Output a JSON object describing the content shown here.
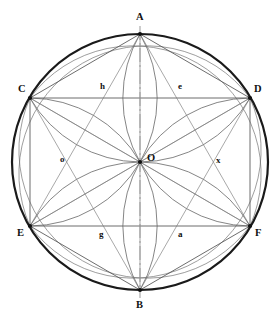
{
  "figure": {
    "canvas": {
      "width": 279,
      "height": 327
    },
    "colors": {
      "outer_circle": "#1a1a1a",
      "chord": "#555555",
      "arc": "#666666",
      "diagonal": "#777777",
      "centerline": "#999999",
      "vertex_dot": "#111111",
      "label": "#111111",
      "background": "#ffffff"
    },
    "circle": {
      "cx": 140,
      "cy": 162,
      "r": 128,
      "stroke_width": 2.2
    },
    "centerline": {
      "name": "vertical-axis",
      "x": 140,
      "y1": 26,
      "y2": 298,
      "dash": "14 3 2 3"
    },
    "vertices": [
      {
        "id": "A",
        "label": "A",
        "x": 140,
        "y": 34,
        "label_x": 136,
        "label_y": 12
      },
      {
        "id": "C",
        "label": "C",
        "x": 30,
        "y": 98,
        "label_x": 18,
        "label_y": 84
      },
      {
        "id": "D",
        "label": "D",
        "x": 250,
        "y": 98,
        "label_x": 254,
        "label_y": 84
      },
      {
        "id": "E",
        "label": "E",
        "x": 30,
        "y": 226,
        "label_x": 17,
        "label_y": 228
      },
      {
        "id": "F",
        "label": "F",
        "x": 250,
        "y": 226,
        "label_x": 255,
        "label_y": 228
      },
      {
        "id": "B",
        "label": "B",
        "x": 140,
        "y": 290,
        "label_x": 136,
        "label_y": 300
      },
      {
        "id": "O",
        "label": "O",
        "x": 140,
        "y": 162,
        "label_x": 147,
        "label_y": 153
      }
    ],
    "marks": [
      {
        "id": "h",
        "label": "h",
        "x": 100,
        "y": 82
      },
      {
        "id": "e",
        "label": "e",
        "x": 178,
        "y": 82
      },
      {
        "id": "o",
        "label": "o",
        "x": 60,
        "y": 155
      },
      {
        "id": "x",
        "label": "x",
        "x": 216,
        "y": 156
      },
      {
        "id": "g",
        "label": "g",
        "x": 99,
        "y": 230
      },
      {
        "id": "a",
        "label": "a",
        "x": 178,
        "y": 230
      }
    ],
    "chords": [
      {
        "name": "chord-CD",
        "x1": 30,
        "y1": 98,
        "x2": 250,
        "y2": 98
      },
      {
        "name": "chord-EF",
        "x1": 30,
        "y1": 226,
        "x2": 250,
        "y2": 226
      },
      {
        "name": "chord-CE",
        "x1": 30,
        "y1": 98,
        "x2": 30,
        "y2": 226
      },
      {
        "name": "chord-DF",
        "x1": 250,
        "y1": 98,
        "x2": 250,
        "y2": 226
      },
      {
        "name": "chord-AC",
        "x1": 140,
        "y1": 34,
        "x2": 30,
        "y2": 98
      },
      {
        "name": "chord-AD",
        "x1": 140,
        "y1": 34,
        "x2": 250,
        "y2": 98
      },
      {
        "name": "chord-BE",
        "x1": 140,
        "y1": 290,
        "x2": 30,
        "y2": 226
      },
      {
        "name": "chord-BF",
        "x1": 140,
        "y1": 290,
        "x2": 250,
        "y2": 226
      }
    ],
    "diagonals": [
      {
        "name": "diagonal-AE",
        "x1": 140,
        "y1": 34,
        "x2": 30,
        "y2": 226
      },
      {
        "name": "diagonal-AF",
        "x1": 140,
        "y1": 34,
        "x2": 250,
        "y2": 226
      },
      {
        "name": "diagonal-BC",
        "x1": 140,
        "y1": 290,
        "x2": 30,
        "y2": 98
      },
      {
        "name": "diagonal-BD",
        "x1": 140,
        "y1": 290,
        "x2": 250,
        "y2": 98
      },
      {
        "name": "diagonal-CF",
        "x1": 30,
        "y1": 98,
        "x2": 250,
        "y2": 226
      },
      {
        "name": "diagonal-DE",
        "x1": 250,
        "y1": 98,
        "x2": 30,
        "y2": 226
      },
      {
        "name": "diagonal-AO-B",
        "x1": 140,
        "y1": 34,
        "x2": 140,
        "y2": 290
      },
      {
        "name": "diagonal-CO-F",
        "x1": 30,
        "y1": 98,
        "x2": 140,
        "y2": 162
      },
      {
        "name": "diagonal-DO-E",
        "x1": 250,
        "y1": 98,
        "x2": 140,
        "y2": 162
      },
      {
        "name": "diagonal-EO",
        "x1": 30,
        "y1": 226,
        "x2": 140,
        "y2": 162
      },
      {
        "name": "diagonal-FO",
        "x1": 250,
        "y1": 226,
        "x2": 140,
        "y2": 162
      }
    ],
    "petal_arcs": [
      {
        "name": "arc-A-O-left",
        "d": "M140,34 A128,128 0 0,0 140,162"
      },
      {
        "name": "arc-A-O-right",
        "d": "M140,34 A128,128 0 0,1 140,162"
      },
      {
        "name": "arc-B-O-left",
        "d": "M140,290 A128,128 0 0,1 140,162"
      },
      {
        "name": "arc-B-O-right",
        "d": "M140,290 A128,128 0 0,0 140,162"
      },
      {
        "name": "arc-C-O-upper",
        "d": "M30,98 A128,128 0 0,1 140,162"
      },
      {
        "name": "arc-C-O-lower",
        "d": "M30,98 A128,128 0 0,0 140,162"
      },
      {
        "name": "arc-D-O-upper",
        "d": "M250,98 A128,128 0 0,0 140,162"
      },
      {
        "name": "arc-D-O-lower",
        "d": "M250,98 A128,128 0 0,1 140,162"
      },
      {
        "name": "arc-E-O-upper",
        "d": "M30,226 A128,128 0 0,0 140,162"
      },
      {
        "name": "arc-E-O-lower",
        "d": "M30,226 A128,128 0 0,1 140,162"
      },
      {
        "name": "arc-F-O-upper",
        "d": "M250,226 A128,128 0 0,1 140,162"
      },
      {
        "name": "arc-F-O-lower",
        "d": "M250,226 A128,128 0 0,0 140,162"
      }
    ],
    "long_arcs": [
      {
        "name": "arc-C-to-F",
        "d": "M30,98 A128,128 0 0,1 250,226"
      },
      {
        "name": "arc-C-to-F-alt",
        "d": "M30,98 A128,128 0 0,0 250,226"
      },
      {
        "name": "arc-D-to-E",
        "d": "M250,98 A128,128 0 0,0 30,226"
      },
      {
        "name": "arc-D-to-E-alt",
        "d": "M250,98 A128,128 0 0,1 30,226"
      }
    ]
  }
}
